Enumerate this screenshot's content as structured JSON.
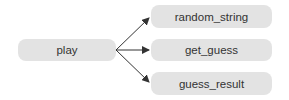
{
  "diagram": {
    "type": "call-graph",
    "colors": {
      "node_fill": "#e3e3e3",
      "node_text": "#333333",
      "edge": "#333333",
      "background": "#ffffff"
    },
    "nodes": [
      {
        "id": "play",
        "label": "play"
      },
      {
        "id": "random_string",
        "label": "random_string"
      },
      {
        "id": "get_guess",
        "label": "get_guess"
      },
      {
        "id": "guess_result",
        "label": "guess_result"
      }
    ],
    "edges": [
      {
        "from": "play",
        "to": "random_string"
      },
      {
        "from": "play",
        "to": "get_guess"
      },
      {
        "from": "play",
        "to": "guess_result"
      }
    ]
  }
}
